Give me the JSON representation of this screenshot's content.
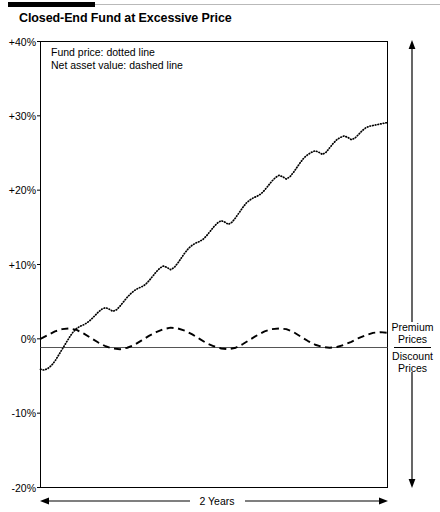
{
  "header": {
    "title": "Closed-End Fund at Excessive Price"
  },
  "legend": {
    "line1": "Fund price: dotted line",
    "line2": "Net asset value: dashed line"
  },
  "annotations": {
    "premium": "Premium",
    "premium_second": "Prices",
    "discount": "Discount",
    "discount_second": "Prices",
    "duration": "2 Years"
  },
  "axis": {
    "y_ticks": [
      "+40%",
      "+30%",
      "+20%",
      "+10%",
      "0%",
      "-10%",
      "-20%"
    ]
  },
  "chart_data": {
    "type": "line",
    "title": "Closed-End Fund at Excessive Price",
    "xlabel": "2 Years",
    "ylabel": "",
    "ylim": [
      -20,
      40
    ],
    "xlim": [
      0,
      24
    ],
    "ytick_values": [
      40,
      30,
      20,
      10,
      0,
      -10,
      -20
    ],
    "ytick_labels": [
      "+40%",
      "+30%",
      "+20%",
      "+10%",
      "0%",
      "-10%",
      "-20%"
    ],
    "grid": false,
    "zero_line": true,
    "legend_position": "top-left-inside",
    "annotations": [
      {
        "text": "Premium Prices",
        "position": "right-above-zero"
      },
      {
        "text": "Discount Prices",
        "position": "right-below-zero"
      },
      {
        "text": "2 Years",
        "position": "below-axis"
      }
    ],
    "series": [
      {
        "name": "Fund price",
        "style": "dotted",
        "color": "#000000",
        "x": [
          0,
          0.25,
          0.5,
          0.75,
          1,
          1.25,
          1.5,
          1.75,
          2,
          2.25,
          2.5,
          2.75,
          3,
          3.25,
          3.5,
          3.75,
          4,
          4.25,
          4.5,
          4.75,
          5,
          5.25,
          5.5,
          5.75,
          6,
          6.25,
          6.5,
          6.75,
          7,
          7.25,
          7.5,
          7.75,
          8,
          8.25,
          8.5,
          8.75,
          9,
          9.25,
          9.5,
          9.75,
          10,
          10.25,
          10.5,
          10.75,
          11,
          11.25,
          11.5,
          11.75,
          12,
          12.25,
          12.5,
          12.75,
          13,
          13.25,
          13.5,
          13.75,
          14,
          14.25,
          14.5,
          14.75,
          15,
          15.25,
          15.5,
          15.75,
          16,
          16.25,
          16.5,
          16.75,
          17,
          17.25,
          17.5,
          17.75,
          18,
          18.25,
          18.5,
          18.75,
          19,
          19.25,
          19.5,
          19.75,
          20,
          20.25,
          20.5,
          20.75,
          21,
          21.25,
          21.5,
          21.75,
          22,
          22.25,
          22.5,
          22.75,
          23,
          23.25,
          23.5,
          23.75,
          24
        ],
        "y": [
          -4.1,
          -4.2,
          -4.0,
          -3.6,
          -3.0,
          -2.2,
          -1.4,
          -0.6,
          0.2,
          0.9,
          1.4,
          1.7,
          1.9,
          2.2,
          2.6,
          3.1,
          3.6,
          4.0,
          4.2,
          4.0,
          3.7,
          3.9,
          4.4,
          5.0,
          5.6,
          6.1,
          6.5,
          6.8,
          7.0,
          7.3,
          7.8,
          8.4,
          9.0,
          9.5,
          9.8,
          9.6,
          9.3,
          9.6,
          10.2,
          10.9,
          11.6,
          12.2,
          12.6,
          12.9,
          13.1,
          13.4,
          13.9,
          14.5,
          15.1,
          15.6,
          15.9,
          15.7,
          15.4,
          15.7,
          16.3,
          17.0,
          17.7,
          18.3,
          18.7,
          19.0,
          19.2,
          19.5,
          20.0,
          20.6,
          21.2,
          21.7,
          22.0,
          21.8,
          21.5,
          21.8,
          22.4,
          23.1,
          23.8,
          24.4,
          24.8,
          25.1,
          25.3,
          25.1,
          24.8,
          25.1,
          25.7,
          26.3,
          26.8,
          27.1,
          27.3,
          27.1,
          26.8,
          27.0,
          27.5,
          28.0,
          28.4,
          28.6,
          28.7,
          28.8,
          28.9,
          29.0,
          29.1
        ]
      },
      {
        "name": "Net asset value",
        "style": "dashed",
        "color": "#000000",
        "x": [
          0,
          0.5,
          1,
          1.5,
          2,
          2.5,
          3,
          3.5,
          4,
          4.5,
          5,
          5.5,
          6,
          6.5,
          7,
          7.5,
          8,
          8.5,
          9,
          9.5,
          10,
          10.5,
          11,
          11.5,
          12,
          12.5,
          13,
          13.5,
          14,
          14.5,
          15,
          15.5,
          16,
          16.5,
          17,
          17.5,
          18,
          18.5,
          19,
          19.5,
          20,
          20.5,
          21,
          21.5,
          22,
          22.5,
          23,
          23.5,
          24
        ],
        "y": [
          0.0,
          0.5,
          1.0,
          1.3,
          1.4,
          1.2,
          0.7,
          0.1,
          -0.5,
          -1.0,
          -1.3,
          -1.4,
          -1.2,
          -0.8,
          -0.2,
          0.4,
          0.9,
          1.3,
          1.5,
          1.4,
          1.1,
          0.6,
          0.0,
          -0.6,
          -1.0,
          -1.3,
          -1.4,
          -1.2,
          -0.7,
          -0.1,
          0.5,
          1.0,
          1.3,
          1.4,
          1.3,
          0.9,
          0.3,
          -0.3,
          -0.8,
          -1.1,
          -1.2,
          -1.1,
          -0.8,
          -0.4,
          0.1,
          0.5,
          0.8,
          0.9,
          0.8
        ]
      }
    ]
  }
}
